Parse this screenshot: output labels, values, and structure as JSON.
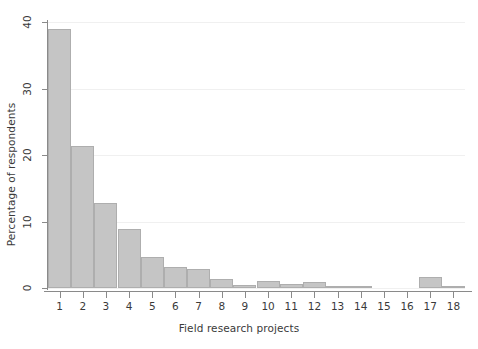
{
  "chart_data": {
    "type": "bar",
    "title": "",
    "subtitle": "",
    "xlabel": "Field research projects",
    "ylabel": "Percentage of respondents",
    "categories": [
      "1",
      "2",
      "3",
      "4",
      "5",
      "6",
      "7",
      "8",
      "9",
      "10",
      "11",
      "12",
      "13",
      "14",
      "15",
      "16",
      "17",
      "18"
    ],
    "values": [
      39.0,
      21.4,
      12.8,
      8.9,
      4.6,
      3.1,
      2.9,
      1.4,
      0.4,
      1.1,
      0.6,
      0.9,
      0.1,
      0.2,
      0.0,
      0.0,
      1.6,
      0.2
    ],
    "series": [
      {
        "name": "Percentage of respondents",
        "values": [
          39.0,
          21.4,
          12.8,
          8.9,
          4.6,
          3.1,
          2.9,
          1.4,
          0.4,
          1.1,
          0.6,
          0.9,
          0.1,
          0.2,
          0.0,
          0.0,
          1.6,
          0.2
        ]
      }
    ],
    "xlim": [
      0.5,
      18.5
    ],
    "ylim": [
      0,
      40
    ],
    "yticks": [
      0,
      10,
      20,
      30,
      40
    ],
    "ytick_labels": [
      "0",
      "10",
      "20",
      "30",
      "40"
    ],
    "xticks": [
      1,
      2,
      3,
      4,
      5,
      6,
      7,
      8,
      9,
      10,
      11,
      12,
      13,
      14,
      15,
      16,
      17,
      18
    ],
    "xtick_labels": [
      "1",
      "2",
      "3",
      "4",
      "5",
      "6",
      "7",
      "8",
      "9",
      "10",
      "11",
      "12",
      "13",
      "14",
      "15",
      "16",
      "17",
      "18"
    ],
    "grid": "horizontal",
    "legend": "none",
    "annotations": [],
    "colors": {
      "bar_fill": "#c5c5c5",
      "bar_border": "#aeaeae",
      "gridline": "#f0f0f0",
      "axis": "#8a8a8a",
      "text": "#3a3a3a",
      "background": "#ffffff"
    }
  }
}
